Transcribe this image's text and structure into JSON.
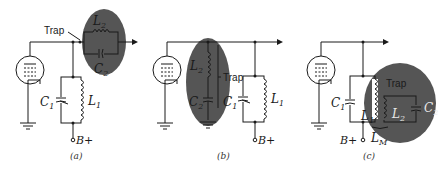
{
  "diagram": {
    "type": "circuit-schematic",
    "highlight_color": "#555555",
    "panels": [
      {
        "id": "a",
        "caption": "(a)",
        "trap_label": "Trap",
        "trap_type": "series parallel-resonant trap in output line",
        "components": {
          "L1": "L",
          "L1_sub": "1",
          "C1": "C",
          "C1_sub": "1",
          "L2": "L",
          "L2_sub": "2",
          "C2": "C",
          "C2_sub": "2"
        },
        "supply": "B+"
      },
      {
        "id": "b",
        "caption": "(b)",
        "trap_label": "Trap",
        "trap_type": "shunt series-resonant trap to ground",
        "components": {
          "L1": "L",
          "L1_sub": "1",
          "C1": "C",
          "C1_sub": "1",
          "L2": "L",
          "L2_sub": "2",
          "C2": "C",
          "C2_sub": "2"
        },
        "supply": "B+"
      },
      {
        "id": "c",
        "caption": "(c)",
        "trap_label": "Trap",
        "trap_type": "inductively coupled absorption trap",
        "components": {
          "L1": "L",
          "L1_sub": "1",
          "C1": "C",
          "C1_sub": "1",
          "L2": "L",
          "L2_sub": "2",
          "C2": "C",
          "C2_sub": "2",
          "LM": "L",
          "LM_sub": "M"
        },
        "supply": "B+"
      }
    ]
  }
}
